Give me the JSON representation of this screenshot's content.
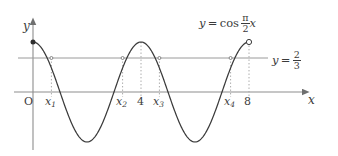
{
  "figure": {
    "type": "math-plot",
    "title_formula": {
      "lhs": "y",
      "equals": "=",
      "func": "cos",
      "numerator": "π",
      "denominator": "2",
      "variable": "x"
    },
    "level_line_label": {
      "lhs": "y",
      "equals": "=",
      "numerator": "2",
      "denominator": "3"
    },
    "axes": {
      "x_axis_name": "x",
      "y_axis_name": "y",
      "origin_label": "O"
    },
    "x_tick_labels": [
      {
        "base": "x",
        "sub": "1"
      },
      {
        "base": "x",
        "sub": "2"
      },
      {
        "base": "4",
        "sub": ""
      },
      {
        "base": "x",
        "sub": "3"
      },
      {
        "base": "x",
        "sub": "4"
      },
      {
        "base": "8",
        "sub": ""
      }
    ],
    "colors": {
      "curve": "#3b3b3b",
      "axis": "#8d8d8d",
      "level_line": "#9a9a9a",
      "dotted_guide": "#a8a8a8",
      "text": "#3b3b3b",
      "background": "#ffffff"
    }
  },
  "chart_data": {
    "type": "line",
    "xlabel": "x",
    "ylabel": "y",
    "function": "y = cos((pi/2)*x)",
    "domain": [
      0,
      8
    ],
    "xlim": [
      -0.7,
      10.2
    ],
    "ylim": [
      -1.22,
      1.35
    ],
    "amplitude": 1,
    "period": 4,
    "grid": false,
    "legend": false,
    "level_line": {
      "label": "y = 2/3",
      "value": 0.6667
    },
    "endpoints": [
      {
        "x": 0,
        "y": 1,
        "marker": "filled-dot"
      },
      {
        "x": 8,
        "y": 1,
        "marker": "open-circle"
      }
    ],
    "x_ticks": [
      {
        "x": 0,
        "label": "O"
      },
      {
        "x": 0.6796,
        "label": "x₁"
      },
      {
        "x": 3.3204,
        "label": "x₂"
      },
      {
        "x": 4,
        "label": "4"
      },
      {
        "x": 4.6796,
        "label": "x₃"
      },
      {
        "x": 7.3204,
        "label": "x₄"
      },
      {
        "x": 8,
        "label": "8"
      }
    ],
    "intersections": [
      {
        "name": "x₁",
        "x": 0.6796,
        "y": 0.6667
      },
      {
        "name": "x₂",
        "x": 3.3204,
        "y": 0.6667
      },
      {
        "name": "x₃",
        "x": 4.6796,
        "y": 0.6667
      },
      {
        "name": "x₄",
        "x": 7.3204,
        "y": 0.6667
      }
    ],
    "maxima": [
      {
        "x": 0,
        "y": 1
      },
      {
        "x": 4,
        "y": 1
      },
      {
        "x": 8,
        "y": 1
      }
    ],
    "minima": [
      {
        "x": 2,
        "y": -1
      },
      {
        "x": 6,
        "y": -1
      }
    ]
  }
}
